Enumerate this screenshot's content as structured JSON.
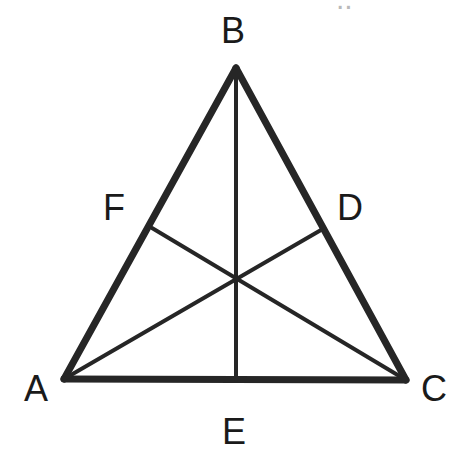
{
  "figure": {
    "kind": "geometry-diagram",
    "background_color": "#ffffff",
    "stroke_color": "#262626",
    "label_color": "#1a1a1a",
    "canvas": {
      "width": 459,
      "height": 465
    },
    "vertices": [
      {
        "id": "A",
        "label": "A",
        "x": 64,
        "y": 379,
        "label_x": 24,
        "label_y": 371
      },
      {
        "id": "B",
        "label": "B",
        "x": 236,
        "y": 68,
        "label_x": 221,
        "label_y": 13
      },
      {
        "id": "C",
        "label": "C",
        "x": 406,
        "y": 380,
        "label_x": 421,
        "label_y": 371
      }
    ],
    "points": [
      {
        "id": "D",
        "label": "D",
        "x": 321,
        "y": 230,
        "on": "BC",
        "label_x": 337,
        "label_y": 190
      },
      {
        "id": "E",
        "label": "E",
        "x": 236,
        "y": 380,
        "on": "AC",
        "label_x": 222,
        "label_y": 414
      },
      {
        "id": "F",
        "label": "F",
        "x": 152,
        "y": 228,
        "on": "AB",
        "label_x": 103,
        "label_y": 190
      }
    ],
    "centroid": {
      "id": "G",
      "label": "",
      "x": 236,
      "y": 281
    },
    "sides": [
      {
        "id": "AB",
        "from": "A",
        "to": "B",
        "width": 7
      },
      {
        "id": "BC",
        "from": "B",
        "to": "C",
        "width": 7
      },
      {
        "id": "AC",
        "from": "A",
        "to": "C",
        "width": 7
      }
    ],
    "cevians": [
      {
        "id": "BE",
        "from": "B",
        "to": "E",
        "width": 4
      },
      {
        "id": "AD",
        "from": "A",
        "to": "D",
        "width": 4
      },
      {
        "id": "CF",
        "from": "C",
        "to": "F",
        "width": 4
      }
    ],
    "corner_artifact": {
      "text": "..",
      "x": 336,
      "y": -16
    }
  }
}
